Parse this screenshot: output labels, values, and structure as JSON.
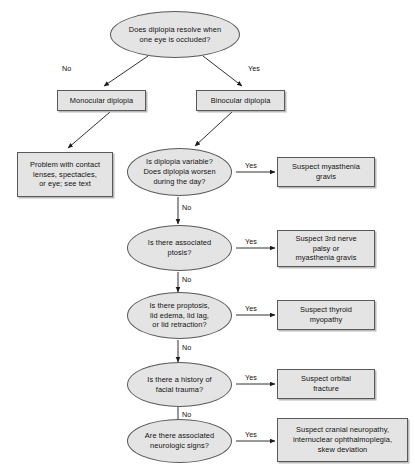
{
  "diagram": {
    "colors": {
      "node_fill": "#e4e4e4",
      "node_stroke": "#58595b",
      "text": "#111111",
      "background": "#ffffff"
    },
    "nodes": [
      {
        "id": "root",
        "shape": "ellipse",
        "text": "Does diplopia resolve when\none eye is occluded?"
      },
      {
        "id": "monocular",
        "shape": "box",
        "text": "Monocular diplopia"
      },
      {
        "id": "binocular",
        "shape": "box",
        "text": "Binocular diplopia"
      },
      {
        "id": "contact-lens-problem",
        "shape": "box",
        "text": "Problem with contact\nlenses, spectacles,\nor eye; see text"
      },
      {
        "id": "variable",
        "shape": "ellipse",
        "text": "Is diplopia variable?\nDoes diplopia worsen\nduring the day?"
      },
      {
        "id": "myasthenia",
        "shape": "box",
        "text": "Suspect myasthenia\ngravis"
      },
      {
        "id": "ptosis",
        "shape": "ellipse",
        "text": "Is there associated\nptosis?"
      },
      {
        "id": "third-nerve",
        "shape": "box",
        "text": "Suspect 3rd nerve\npalsy or\nmyasthenia gravis"
      },
      {
        "id": "proptosis",
        "shape": "ellipse",
        "text": "Is there proptosis,\nlid edema, lid lag,\nor lid retraction?"
      },
      {
        "id": "thyroid",
        "shape": "box",
        "text": "Suspect thyroid\nmyopathy"
      },
      {
        "id": "trauma",
        "shape": "ellipse",
        "text": "Is there a history of\nfacial trauma?"
      },
      {
        "id": "orbital-fracture",
        "shape": "box",
        "text": "Suspect orbital\nfracture"
      },
      {
        "id": "neuro-signs",
        "shape": "ellipse",
        "text": "Are there associated\nneurologic signs?"
      },
      {
        "id": "cranial-neuropathy",
        "shape": "box",
        "text": "Suspect cranial neuropathy,\ninternuclear ophthalmoplegia,\nskew deviation"
      }
    ],
    "edge_labels": [
      {
        "id": "root-no",
        "text": "No"
      },
      {
        "id": "root-yes",
        "text": "Yes"
      },
      {
        "id": "variable-yes",
        "text": "Yes"
      },
      {
        "id": "variable-no",
        "text": "No"
      },
      {
        "id": "ptosis-yes",
        "text": "Yes"
      },
      {
        "id": "ptosis-no",
        "text": "No"
      },
      {
        "id": "proptosis-yes",
        "text": "Yes"
      },
      {
        "id": "proptosis-no",
        "text": "No"
      },
      {
        "id": "trauma-yes",
        "text": "Yes"
      },
      {
        "id": "trauma-no",
        "text": "No"
      },
      {
        "id": "neuro-yes",
        "text": "Yes"
      }
    ]
  }
}
